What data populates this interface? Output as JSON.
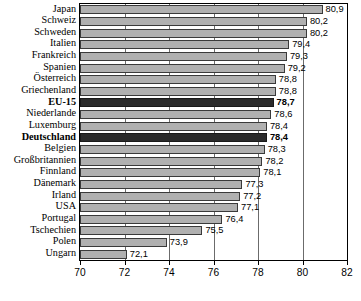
{
  "chart_data": {
    "type": "bar",
    "orientation": "horizontal",
    "title": "",
    "xlabel": "",
    "ylabel": "",
    "xlim": [
      70,
      82
    ],
    "xticks": [
      70,
      72,
      74,
      76,
      78,
      80,
      82
    ],
    "xtick_labels": [
      "70",
      "72",
      "74",
      "76",
      "78",
      "80",
      "82"
    ],
    "grid": true,
    "grid_axis": "x",
    "legend": false,
    "decimal_separator": ",",
    "categories": [
      "Japan",
      "Schweiz",
      "Schweden",
      "Italien",
      "Frankreich",
      "Spanien",
      "Österreich",
      "Griechenland",
      "EU-15",
      "Niederlande",
      "Luxemburg",
      "Deutschland",
      "Belgien",
      "Großbritannien",
      "Finnland",
      "Dänemark",
      "Irland",
      "USA",
      "Portugal",
      "Tschechien",
      "Polen",
      "Ungarn"
    ],
    "values": [
      80.9,
      80.2,
      80.2,
      79.4,
      79.3,
      79.2,
      78.8,
      78.8,
      78.7,
      78.6,
      78.4,
      78.4,
      78.3,
      78.2,
      78.1,
      77.3,
      77.2,
      77.1,
      76.4,
      75.5,
      73.9,
      72.1
    ],
    "value_labels": [
      "80,9",
      "80,2",
      "80,2",
      "79,4",
      "79,3",
      "79,2",
      "78,8",
      "78,8",
      "78,7",
      "78,6",
      "78,4",
      "78,4",
      "78,3",
      "78,2",
      "78,1",
      "77,3",
      "77,2",
      "77,1",
      "76,4",
      "75,5",
      "73,9",
      "72,1"
    ],
    "highlighted": [
      "EU-15",
      "Deutschland"
    ],
    "colors": {
      "bar": "#b0b0b0",
      "bar_highlight": "#2b2b2b",
      "bar_edge": "#3a3a3a",
      "axis": "#000000",
      "gridline": "#6b6b6b",
      "text": "#000000",
      "background": "#ffffff"
    }
  }
}
